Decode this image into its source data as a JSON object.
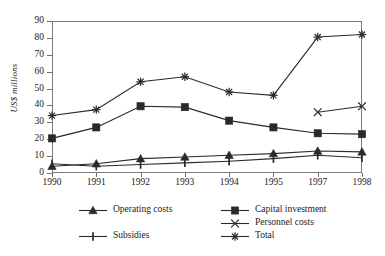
{
  "chart_data": {
    "type": "line",
    "title": "",
    "xlabel": "",
    "ylabel": "US$ millions",
    "ylim": [
      0,
      90
    ],
    "ytick_step": 10,
    "grid": false,
    "legend_position": "bottom",
    "categories": [
      "1990",
      "1991",
      "1992",
      "1993",
      "1994",
      "1995",
      "1997",
      "1998"
    ],
    "yticks": [
      "0",
      "10",
      "20",
      "30",
      "40",
      "50",
      "60",
      "70",
      "80",
      "90"
    ],
    "series": [
      {
        "name": "Operating costs",
        "marker": "triangle",
        "values": [
          4,
          5.5,
          8.5,
          9.5,
          10.5,
          11.5,
          13,
          12.5
        ]
      },
      {
        "name": "Capital investment",
        "marker": "square",
        "values": [
          20.5,
          27,
          39.5,
          39,
          31,
          27,
          23.5,
          23
        ]
      },
      {
        "name": "Subsidies",
        "marker": "ibar",
        "values": [
          5.5,
          4,
          5,
          6,
          7,
          8.5,
          10.5,
          9
        ]
      },
      {
        "name": "Personnel costs",
        "marker": "cross",
        "values": [
          null,
          null,
          null,
          null,
          null,
          null,
          36,
          39.5
        ]
      },
      {
        "name": "Total",
        "marker": "asterisk",
        "values": [
          34,
          37.5,
          54,
          57,
          48,
          46,
          80.5,
          82
        ]
      }
    ],
    "legend_columns": [
      [
        "Operating costs",
        "Subsidies"
      ],
      [
        "Capital investment",
        "Personnel costs",
        "Total"
      ]
    ],
    "colors": {
      "line": "#2a2a2a",
      "axis": "#7a7a7a",
      "text": "#1a1a1a",
      "background": "#ffffff"
    }
  }
}
